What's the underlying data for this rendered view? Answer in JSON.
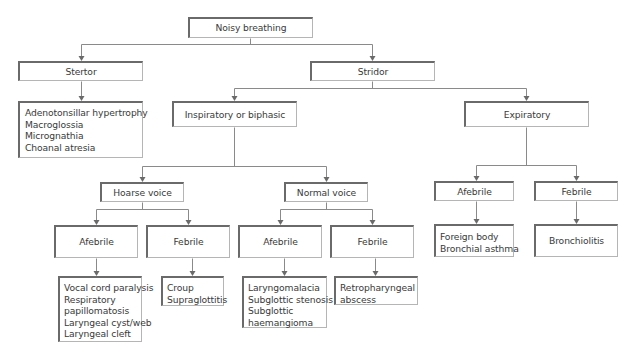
{
  "diagram": {
    "root": {
      "label": "Noisy breathing"
    },
    "stertor": {
      "label": "Stertor",
      "causes": [
        "Adenotonsillar hypertrophy",
        "Macroglossia",
        "Micrognathia",
        "Choanal atresia"
      ]
    },
    "stridor": {
      "label": "Stridor",
      "inspiratory": {
        "label": "Inspiratory or biphasic",
        "hoarse_voice": {
          "label": "Hoarse voice",
          "afebrile": {
            "label": "Afebrile",
            "causes": [
              "Vocal cord paralysis",
              "Respiratory",
              "papillomatosis",
              "Laryngeal cyst/web",
              "Laryngeal cleft"
            ]
          },
          "febrile": {
            "label": "Febrile",
            "causes": [
              "Croup",
              "Supraglottitis"
            ]
          }
        },
        "normal_voice": {
          "label": "Normal voice",
          "afebrile": {
            "label": "Afebrile",
            "causes": [
              "Laryngomalacia",
              "Subglottic stenosis",
              "Subglottic",
              "haemangioma"
            ]
          },
          "febrile": {
            "label": "Febrile",
            "causes": [
              "Retropharyngeal",
              "abscess"
            ]
          }
        }
      },
      "expiratory": {
        "label": "Expiratory",
        "afebrile": {
          "label": "Afebrile",
          "causes": [
            "Foreign body",
            "Bronchial asthma"
          ]
        },
        "febrile": {
          "label": "Febrile",
          "causes": [
            "Bronchiolitis"
          ]
        }
      }
    }
  }
}
